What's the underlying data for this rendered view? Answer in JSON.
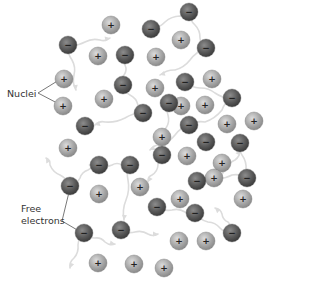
{
  "diagram": {
    "labels": {
      "nuclei": "Nuclei",
      "free_electrons_line1": "Free",
      "free_electrons_line2": "electrons"
    },
    "colors": {
      "nucleus_fill": "#a9a9a9",
      "nucleus_highlight": "#d6d6d6",
      "electron_fill": "#5a5a5a",
      "electron_highlight": "#8c8c8c",
      "path_color": "#dcdcdc",
      "leader_line": "#555555",
      "text": "#333333"
    },
    "symbols": {
      "nucleus": "+",
      "electron": "−"
    },
    "nuclei": [
      [
        111,
        25
      ],
      [
        181,
        40
      ],
      [
        98,
        56
      ],
      [
        156,
        57
      ],
      [
        64,
        79
      ],
      [
        155,
        88
      ],
      [
        212,
        79
      ],
      [
        63,
        106
      ],
      [
        104,
        99
      ],
      [
        181,
        106
      ],
      [
        205,
        105
      ],
      [
        227,
        124
      ],
      [
        254,
        121
      ],
      [
        162,
        137
      ],
      [
        68,
        148
      ],
      [
        187,
        156
      ],
      [
        222,
        163
      ],
      [
        140,
        187
      ],
      [
        214,
        178
      ],
      [
        99,
        194
      ],
      [
        180,
        199
      ],
      [
        243,
        199
      ],
      [
        179,
        241
      ],
      [
        206,
        241
      ],
      [
        98,
        263
      ],
      [
        134,
        264
      ],
      [
        164,
        268
      ]
    ],
    "electrons": [
      [
        151,
        29
      ],
      [
        189,
        12
      ],
      [
        206,
        48
      ],
      [
        68,
        45
      ],
      [
        125,
        55
      ],
      [
        123,
        85
      ],
      [
        185,
        82
      ],
      [
        232,
        98
      ],
      [
        169,
        103
      ],
      [
        143,
        113
      ],
      [
        85,
        126
      ],
      [
        189,
        125
      ],
      [
        206,
        142
      ],
      [
        240,
        143
      ],
      [
        162,
        155
      ],
      [
        130,
        165
      ],
      [
        99,
        165
      ],
      [
        70,
        186
      ],
      [
        197,
        181
      ],
      [
        247,
        178
      ],
      [
        157,
        207
      ],
      [
        195,
        213
      ],
      [
        232,
        233
      ],
      [
        84,
        233
      ],
      [
        121,
        230
      ]
    ],
    "electron_paths": [
      [
        [
          68,
          45
        ],
        [
          85,
          42
        ],
        [
          100,
          40
        ],
        [
          110,
          38
        ]
      ],
      [
        [
          151,
          29
        ],
        [
          165,
          22
        ],
        [
          180,
          16
        ],
        [
          189,
          12
        ]
      ],
      [
        [
          189,
          12
        ],
        [
          195,
          25
        ],
        [
          200,
          38
        ],
        [
          206,
          48
        ]
      ],
      [
        [
          206,
          48
        ],
        [
          190,
          60
        ],
        [
          175,
          70
        ],
        [
          160,
          75
        ]
      ],
      [
        [
          68,
          45
        ],
        [
          72,
          60
        ],
        [
          74,
          75
        ],
        [
          76,
          90
        ]
      ],
      [
        [
          125,
          55
        ],
        [
          125,
          65
        ],
        [
          124,
          75
        ],
        [
          123,
          85
        ]
      ],
      [
        [
          123,
          85
        ],
        [
          130,
          95
        ],
        [
          138,
          105
        ],
        [
          143,
          113
        ]
      ],
      [
        [
          185,
          82
        ],
        [
          200,
          88
        ],
        [
          215,
          93
        ],
        [
          232,
          98
        ]
      ],
      [
        [
          143,
          113
        ],
        [
          125,
          118
        ],
        [
          105,
          122
        ],
        [
          95,
          125
        ]
      ],
      [
        [
          232,
          98
        ],
        [
          222,
          110
        ],
        [
          205,
          122
        ],
        [
          189,
          125
        ]
      ],
      [
        [
          169,
          103
        ],
        [
          168,
          115
        ],
        [
          166,
          128
        ],
        [
          165,
          140
        ]
      ],
      [
        [
          189,
          125
        ],
        [
          175,
          135
        ],
        [
          160,
          145
        ],
        [
          150,
          150
        ]
      ],
      [
        [
          240,
          143
        ],
        [
          242,
          155
        ],
        [
          246,
          170
        ],
        [
          247,
          178
        ]
      ],
      [
        [
          247,
          178
        ],
        [
          232,
          175
        ],
        [
          215,
          178
        ],
        [
          197,
          181
        ]
      ],
      [
        [
          130,
          165
        ],
        [
          128,
          180
        ],
        [
          126,
          200
        ],
        [
          124,
          220
        ]
      ],
      [
        [
          99,
          165
        ],
        [
          112,
          165
        ],
        [
          122,
          165
        ],
        [
          130,
          165
        ]
      ],
      [
        [
          70,
          186
        ],
        [
          60,
          175
        ],
        [
          50,
          165
        ],
        [
          46,
          158
        ]
      ],
      [
        [
          70,
          186
        ],
        [
          80,
          178
        ],
        [
          88,
          170
        ],
        [
          93,
          162
        ]
      ],
      [
        [
          162,
          155
        ],
        [
          158,
          165
        ],
        [
          152,
          175
        ],
        [
          148,
          182
        ]
      ],
      [
        [
          157,
          207
        ],
        [
          172,
          210
        ],
        [
          185,
          212
        ],
        [
          195,
          213
        ]
      ],
      [
        [
          195,
          213
        ],
        [
          208,
          222
        ],
        [
          220,
          228
        ],
        [
          232,
          233
        ]
      ],
      [
        [
          84,
          233
        ],
        [
          95,
          238
        ],
        [
          105,
          242
        ],
        [
          115,
          244
        ]
      ],
      [
        [
          84,
          233
        ],
        [
          78,
          245
        ],
        [
          74,
          258
        ],
        [
          70,
          268
        ]
      ],
      [
        [
          121,
          230
        ],
        [
          135,
          232
        ],
        [
          148,
          234
        ],
        [
          158,
          234
        ]
      ],
      [
        [
          232,
          233
        ],
        [
          228,
          222
        ],
        [
          222,
          214
        ],
        [
          215,
          208
        ]
      ],
      [
        [
          214,
          178
        ],
        [
          225,
          170
        ],
        [
          235,
          160
        ],
        [
          240,
          150
        ]
      ]
    ],
    "leader_lines": {
      "nuclei": [
        [
          [
            38,
            93
          ],
          [
            59,
            80
          ]
        ],
        [
          [
            38,
            93
          ],
          [
            59,
            104
          ]
        ]
      ],
      "free_electrons": [
        [
          [
            62,
            221
          ],
          [
            70,
            188
          ]
        ],
        [
          [
            62,
            221
          ],
          [
            79,
            231
          ]
        ]
      ]
    }
  }
}
